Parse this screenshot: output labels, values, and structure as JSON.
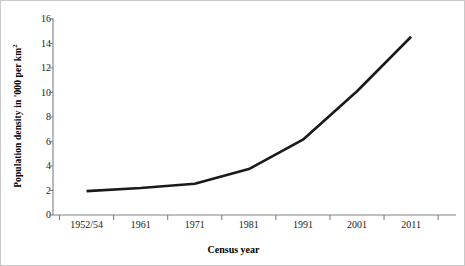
{
  "chart_data": {
    "type": "line",
    "title": "",
    "subtitle": "",
    "xlabel": "Census year",
    "ylabel_parts": {
      "base": "Population density in '000 per km",
      "exponent": "2"
    },
    "ylabel": "Population density in '000 per km²",
    "categories": [
      "1952/54",
      "1961",
      "1971",
      "1981",
      "1991",
      "2001",
      "2011"
    ],
    "values": [
      1.95,
      2.2,
      2.55,
      3.75,
      6.15,
      10.1,
      14.55
    ],
    "series": [
      {
        "name": "Population density",
        "values": [
          1.95,
          2.2,
          2.55,
          3.75,
          6.15,
          10.1,
          14.55
        ],
        "color": "#1a1a1a",
        "line_width": 2.6,
        "marker": "none"
      }
    ],
    "ylim": [
      0,
      16
    ],
    "yticks": [
      0,
      2,
      4,
      6,
      8,
      10,
      12,
      14,
      16
    ],
    "ytick_labels": [
      "0",
      "2",
      "4",
      "6",
      "8",
      "10",
      "12",
      "14",
      "16"
    ],
    "xtick_labels": [
      "1952/54",
      "1961",
      "1971",
      "1981",
      "1991",
      "2001",
      "2011"
    ],
    "grid": false,
    "legend": false,
    "legend_position": "none",
    "axis_color": "#808080",
    "background": "#ffffff",
    "annotations": []
  },
  "figure": {
    "border_color": "#c9c9c9",
    "plot_left": 52,
    "plot_right": 455,
    "plot_top": 18,
    "plot_bottom": 214
  }
}
